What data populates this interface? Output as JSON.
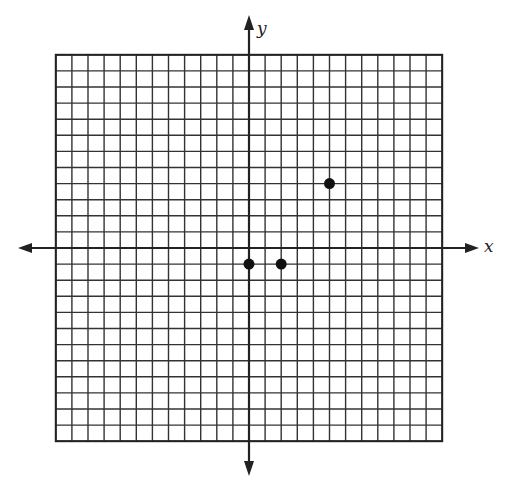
{
  "chart_data": {
    "type": "scatter",
    "title": "",
    "xlabel": "x",
    "ylabel": "y",
    "xlim": [
      -12,
      12
    ],
    "ylim": [
      -12,
      12
    ],
    "grid": true,
    "points": [
      {
        "x": 0,
        "y": -1
      },
      {
        "x": 2,
        "y": -1
      },
      {
        "x": 5,
        "y": 4
      }
    ]
  },
  "labels": {
    "x_axis": "x",
    "y_axis": "y"
  }
}
